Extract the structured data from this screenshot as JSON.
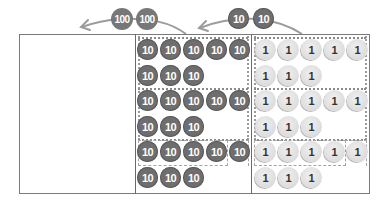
{
  "diagram": {
    "colors": {
      "ten_counter": "#6e6e6e",
      "one_counter": "#dcdcdc",
      "hundred_counter": "#777777",
      "frame": "#7a7a7a",
      "arrow": "#9a9a9a"
    },
    "exchange_top": {
      "hundreds": {
        "labels": [
          "100",
          "100"
        ]
      },
      "tens": {
        "labels": [
          "10",
          "10"
        ]
      }
    },
    "columns": {
      "hundreds": {
        "rows": []
      },
      "tens": {
        "rows": [
          {
            "line1": [
              "10",
              "10",
              "10",
              "10",
              "10"
            ],
            "line2": [
              "10",
              "10",
              "10"
            ]
          },
          {
            "line1": [
              "10",
              "10",
              "10",
              "10",
              "10"
            ],
            "line2": [
              "10",
              "10",
              "10"
            ]
          },
          {
            "line1": [
              "10",
              "10",
              "10",
              "10",
              "10"
            ],
            "line2": [
              "10",
              "10",
              "10"
            ]
          }
        ]
      },
      "ones": {
        "rows": [
          {
            "line1": [
              "1",
              "1",
              "1",
              "1",
              "1"
            ],
            "line2": [
              "1",
              "1",
              "1"
            ]
          },
          {
            "line1": [
              "1",
              "1",
              "1",
              "1",
              "1"
            ],
            "line2": [
              "1",
              "1",
              "1"
            ]
          },
          {
            "line1": [
              "1",
              "1",
              "1",
              "1",
              "1"
            ],
            "line2": [
              "1",
              "1",
              "1"
            ]
          }
        ]
      }
    }
  }
}
